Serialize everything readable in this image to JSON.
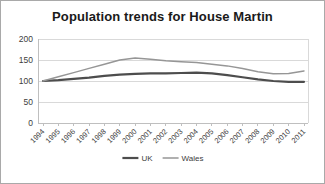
{
  "chart_data": {
    "type": "line",
    "title": "Population trends for House Martin",
    "x": [
      "1994",
      "1995",
      "1996",
      "1997",
      "1998",
      "1999",
      "2000",
      "2001",
      "2002",
      "2003",
      "2004",
      "2005",
      "2006",
      "2007",
      "2008",
      "2009",
      "2010",
      "2011"
    ],
    "series": [
      {
        "name": "UK",
        "color": "#4d4d4d",
        "stroke_width": 2.2,
        "values": [
          100,
          102,
          105,
          108,
          112,
          115,
          117,
          118,
          118,
          119,
          120,
          118,
          114,
          109,
          104,
          100,
          98,
          98
        ]
      },
      {
        "name": "Wales",
        "color": "#969696",
        "stroke_width": 1.5,
        "values": [
          100,
          110,
          120,
          130,
          140,
          150,
          155,
          152,
          148,
          146,
          144,
          140,
          136,
          130,
          122,
          117,
          118,
          124
        ]
      }
    ],
    "ylim": [
      0,
      200
    ],
    "yticks": [
      0,
      50,
      100,
      150,
      200
    ],
    "grid": true,
    "legend_position": "bottom",
    "xlabel": "",
    "ylabel": ""
  },
  "style_colors": {
    "grid": "#d9d9d9",
    "axis": "#bfbfbf",
    "tick_label": "#404040",
    "title": "#1a1a1a",
    "frame_border": "#a9a9a9"
  }
}
